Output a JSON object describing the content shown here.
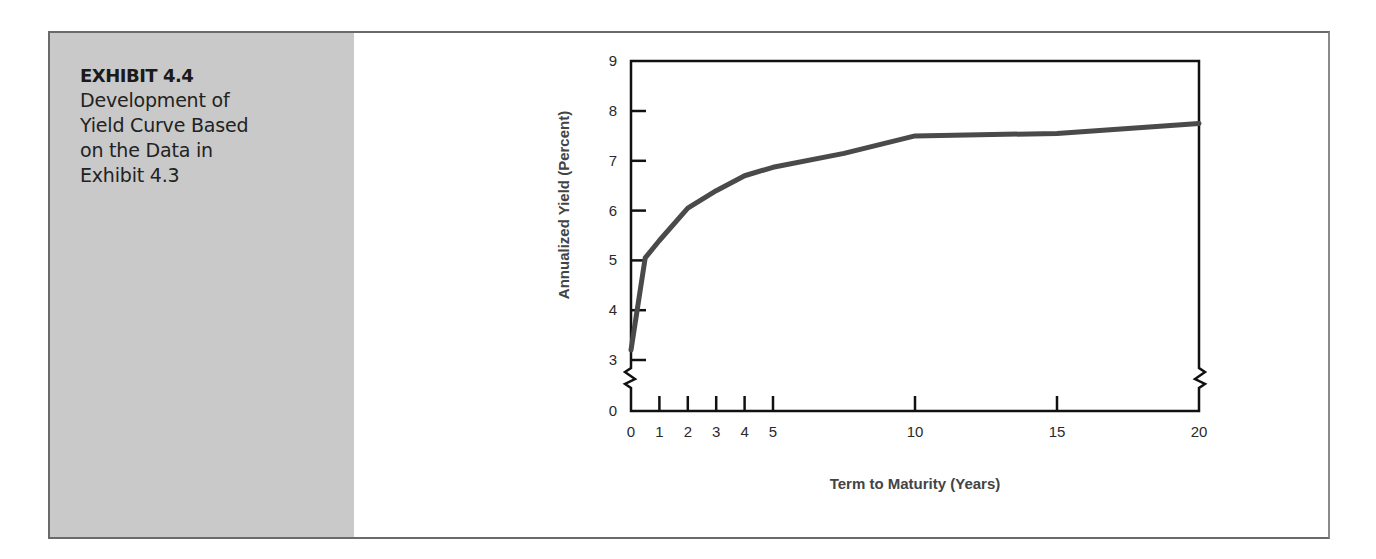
{
  "exhibit": {
    "label": "EXHIBIT 4.4",
    "title_lines": [
      "Development of",
      "Yield Curve Based",
      "on the Data in",
      "Exhibit 4.3"
    ]
  },
  "colors": {
    "sidebar": "#c9c9c9",
    "curve": "#4a4a4a",
    "axis": "#111111"
  },
  "chart_data": {
    "type": "line",
    "title": "Development of Yield Curve Based on the Data in Exhibit 4.3",
    "xlabel": "Term to Maturity (Years)",
    "ylabel": "Annualized Yield (Percent)",
    "x_ticks": [
      0,
      1,
      2,
      3,
      4,
      5,
      10,
      15,
      20
    ],
    "y_ticks": [
      0,
      3,
      4,
      5,
      6,
      7,
      8,
      9
    ],
    "xlim": [
      0,
      20
    ],
    "ylim": [
      0,
      9
    ],
    "axis_breaks": {
      "y": "between 0 and 3 (both left and right axes)"
    },
    "grid": false,
    "legend": null,
    "series": [
      {
        "name": "Yield Curve",
        "x": [
          0,
          0.5,
          1,
          2,
          3,
          4,
          5,
          7.5,
          10,
          15,
          20
        ],
        "values": [
          3.2,
          5.05,
          5.4,
          6.05,
          6.4,
          6.7,
          6.87,
          7.15,
          7.5,
          7.55,
          7.75
        ]
      }
    ]
  }
}
